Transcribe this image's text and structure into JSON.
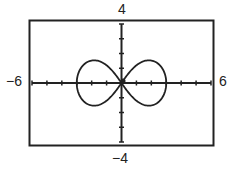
{
  "chart_data": {
    "type": "line",
    "title": "",
    "xlabel": "",
    "ylabel": "",
    "xlim": [
      -6,
      6
    ],
    "ylim": [
      -4,
      4
    ],
    "x_tick_step": 1,
    "y_tick_step": 1,
    "grid": false,
    "legend": null,
    "window_labels": {
      "xmin": "−6",
      "xmax": "6",
      "ymin": "−4",
      "ymax": "4"
    },
    "series": [
      {
        "name": "lemniscate",
        "description": "Figure-eight (lemniscate) curve centered at origin, loops extending to x = ±3, peak |y| ≈ 1",
        "parameter_a": 3,
        "points": [
          [
            3.0,
            0.0
          ],
          [
            2.9,
            0.5
          ],
          [
            2.5,
            0.9
          ],
          [
            2.0,
            1.05
          ],
          [
            1.5,
            1.0
          ],
          [
            1.0,
            0.8
          ],
          [
            0.5,
            0.45
          ],
          [
            0.0,
            0.0
          ],
          [
            -0.5,
            -0.45
          ],
          [
            -1.0,
            -0.8
          ],
          [
            -1.5,
            -1.0
          ],
          [
            -2.0,
            -1.05
          ],
          [
            -2.5,
            -0.9
          ],
          [
            -2.9,
            -0.5
          ],
          [
            -3.0,
            0.0
          ],
          [
            -2.9,
            0.5
          ],
          [
            -2.5,
            0.9
          ],
          [
            -2.0,
            1.05
          ],
          [
            -1.5,
            1.0
          ],
          [
            -1.0,
            0.8
          ],
          [
            -0.5,
            0.45
          ],
          [
            0.0,
            0.0
          ],
          [
            0.5,
            -0.45
          ],
          [
            1.0,
            -0.8
          ],
          [
            1.5,
            -1.0
          ],
          [
            2.0,
            -1.05
          ],
          [
            2.5,
            -0.9
          ],
          [
            2.9,
            -0.5
          ],
          [
            3.0,
            0.0
          ]
        ]
      }
    ]
  }
}
